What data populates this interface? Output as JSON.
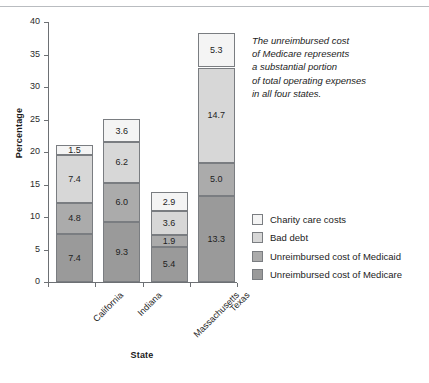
{
  "chart_data": {
    "type": "bar",
    "subtype": "stacked-bar",
    "title": "",
    "xlabel": "State",
    "ylabel": "Percentage",
    "ylim": [
      0,
      40
    ],
    "ytick_labels": [
      "0",
      "5",
      "10",
      "15",
      "20",
      "25",
      "30",
      "35",
      "40"
    ],
    "ytick_values": [
      0,
      5,
      10,
      15,
      20,
      25,
      30,
      35,
      40
    ],
    "grid": false,
    "legend_position": "right",
    "categories": [
      "California",
      "Indiana",
      "Massachusetts",
      "Texas"
    ],
    "series": [
      {
        "name": "Unreimbursed cost of Medicare",
        "color": "#9a9a9a",
        "values": [
          7.4,
          9.3,
          5.4,
          13.3
        ]
      },
      {
        "name": "Unreimbursed cost of Medicaid",
        "color": "#ababab",
        "values": [
          4.8,
          6.0,
          1.9,
          5.0
        ]
      },
      {
        "name": "Bad debt",
        "color": "#d7d7d7",
        "values": [
          7.4,
          6.2,
          3.6,
          14.7
        ]
      },
      {
        "name": "Charity care costs",
        "color": "#f4f4f4",
        "values": [
          1.5,
          3.6,
          2.9,
          5.3
        ]
      }
    ],
    "totals": [
      21.1,
      25.1,
      13.8,
      38.3
    ],
    "annotation": [
      "The unreimbursed cost",
      "of Medicare represents",
      "a substantial portion",
      "of total operating expenses",
      "in all four states."
    ]
  },
  "legend": {
    "items": [
      {
        "label": "Charity care costs",
        "color": "#f4f4f4"
      },
      {
        "label": "Bad debt",
        "color": "#d7d7d7"
      },
      {
        "label": "Unreimbursed cost of Medicaid",
        "color": "#ababab"
      },
      {
        "label": "Unreimbursed cost of Medicare",
        "color": "#9a9a9a"
      }
    ]
  }
}
